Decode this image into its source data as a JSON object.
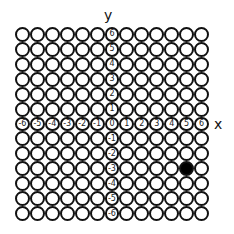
{
  "diagram": {
    "type": "coordinate-grid-of-circles",
    "x_axis_label": "x",
    "y_axis_label": "y",
    "x_range": [
      -6,
      6
    ],
    "y_range": [
      -6,
      6
    ],
    "x_tick_labels": [
      "-6",
      "-5",
      "-4",
      "-3",
      "-2",
      "-1",
      "0",
      "1",
      "2",
      "3",
      "4",
      "5",
      "6"
    ],
    "y_tick_labels": [
      "6",
      "5",
      "4",
      "3",
      "2",
      "1",
      "0",
      "-1",
      "-2",
      "-3",
      "-4",
      "-5",
      "-6"
    ],
    "filled_points": [
      {
        "x": 5,
        "y": -3
      }
    ],
    "colors": {
      "outline": "#111111",
      "filled": "#000000",
      "empty": "#ffffff"
    }
  }
}
